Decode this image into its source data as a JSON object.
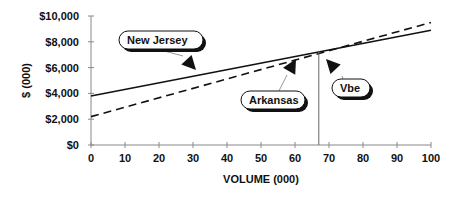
{
  "chart_data": {
    "type": "line",
    "title": "",
    "xlabel": "VOLUME (000)",
    "ylabel": "$ (000)",
    "xlim": [
      0,
      100
    ],
    "ylim": [
      0,
      10000
    ],
    "x_ticks": [
      "0",
      "10",
      "20",
      "30",
      "40",
      "50",
      "60",
      "70",
      "80",
      "90",
      "100"
    ],
    "y_ticks": [
      "$0",
      "$2,000",
      "$4,000",
      "$6,000",
      "$8,000",
      "$10,000"
    ],
    "grid": false,
    "series": [
      {
        "name": "New Jersey",
        "style": "solid",
        "x": [
          0,
          100
        ],
        "values": [
          3800,
          8900
        ]
      },
      {
        "name": "Arkansas",
        "style": "dashed",
        "x": [
          0,
          100
        ],
        "values": [
          2200,
          9500
        ]
      }
    ],
    "annotations": [
      {
        "text": "New Jersey",
        "points_to": "New Jersey line"
      },
      {
        "text": "Arkansas",
        "points_to": "Arkansas line"
      },
      {
        "text": "Vbe",
        "points_to": "intersection",
        "x": 67
      }
    ],
    "vertical_line_x": 67
  }
}
